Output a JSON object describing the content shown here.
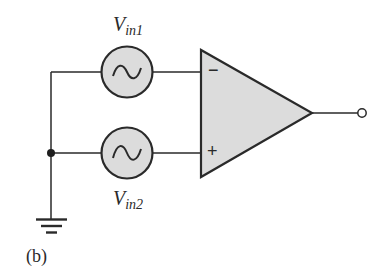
{
  "diagram": {
    "type": "op-amp differential input circuit",
    "caption": "(b)",
    "sources": [
      {
        "id": "vin1",
        "label_main": "V",
        "label_sub": "in1",
        "symbol": "ac-source",
        "connects_to": "inverting input (−)"
      },
      {
        "id": "vin2",
        "label_main": "V",
        "label_sub": "in2",
        "symbol": "ac-source",
        "connects_to": "non-inverting input (+)"
      }
    ],
    "opamp": {
      "inverting_symbol": "−",
      "noninverting_symbol": "+",
      "output": "open terminal"
    },
    "ground": "ground-icon",
    "colors": {
      "stroke": "#2a2a2a",
      "fill": "#dcdcdc",
      "background": "#ffffff"
    }
  }
}
